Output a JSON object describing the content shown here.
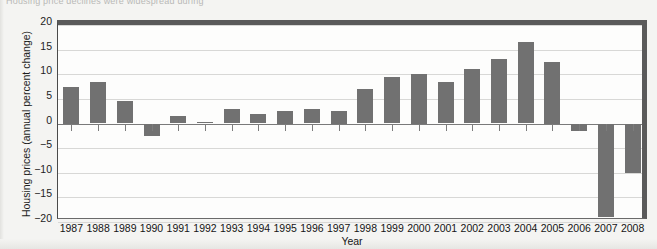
{
  "top_caption": "Housing price declines were widespread during",
  "chart_data": {
    "type": "bar",
    "title": "",
    "xlabel": "Year",
    "ylabel": "Housing prices (annual percent change)",
    "categories": [
      "1987",
      "1988",
      "1989",
      "1990",
      "1991",
      "1992",
      "1993",
      "1994",
      "1995",
      "1996",
      "1997",
      "1998",
      "1999",
      "2000",
      "2001",
      "2002",
      "2003",
      "2004",
      "2005",
      "2006",
      "2007",
      "2008"
    ],
    "values": [
      7.5,
      8.5,
      4.5,
      -2.5,
      1.5,
      0.3,
      3.0,
      2.0,
      2.5,
      3.0,
      2.5,
      7.0,
      9.5,
      10.0,
      8.5,
      11.0,
      13.0,
      16.5,
      12.5,
      -1.5,
      -19.0,
      -10.0
    ],
    "ylim": [
      -20,
      20
    ],
    "yticks": [
      20,
      15,
      10,
      5,
      0,
      -5,
      -10,
      -15,
      -20
    ],
    "ytick_labels": [
      "20",
      "15",
      "10",
      "5",
      "0",
      "−5",
      "−10",
      "−15",
      "−20"
    ],
    "grid": true,
    "legend": "none",
    "bar_color": "#717171",
    "gridline_color": "#d8d8d6",
    "axis_color": "#4a4a4a",
    "plot_background": "#fdfdfc",
    "page_background": "#f4f4f2"
  }
}
